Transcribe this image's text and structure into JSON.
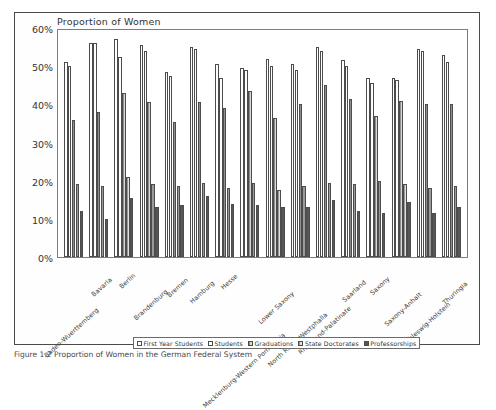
{
  "figure": {
    "caption": "Figure 1.2 Proportion of Women in the German Federal System"
  },
  "chart_data": {
    "type": "bar",
    "title": "Proportion of Women",
    "xlabel": "",
    "ylabel": "",
    "ylim": [
      0,
      60
    ],
    "ytick_labels": [
      "0%",
      "10%",
      "20%",
      "30%",
      "40%",
      "50%",
      "60%"
    ],
    "ytick_values": [
      0,
      10,
      20,
      30,
      40,
      50,
      60
    ],
    "grid": false,
    "legend_position": "bottom",
    "categories": [
      "Baden-Wuerttemberg",
      "Bavaria",
      "Berlin",
      "Brandenburg",
      "Bremen",
      "Hamburg",
      "Hesse",
      "Mecklenburg-Western Pomerania",
      "Lower Saxony",
      "North Rhine-Westphalia",
      "Rhineland-Palatinate",
      "Saarland",
      "Saxony",
      "Saxony-Anhalt",
      "Schleswig-Holstein",
      "Thuringia"
    ],
    "series": [
      {
        "name": "First Year Students",
        "values": [
          51,
          56,
          57,
          55.5,
          48.5,
          55,
          50.5,
          49.5,
          52,
          50.5,
          55,
          51.5,
          47,
          47,
          54.5,
          53
        ]
      },
      {
        "name": "Students",
        "values": [
          50,
          56,
          52.5,
          54,
          47.5,
          54.5,
          47,
          49,
          50,
          49,
          54,
          50,
          45.5,
          46.5,
          54,
          51
        ]
      },
      {
        "name": "Graduations",
        "values": [
          36,
          38,
          43,
          40.5,
          35.5,
          40.5,
          39,
          43.5,
          36.5,
          40,
          45,
          41.5,
          37,
          41,
          40,
          40
        ]
      },
      {
        "name": "State Doctorates",
        "values": [
          19,
          18.5,
          21,
          19,
          18.5,
          19.5,
          18,
          19.5,
          17.5,
          18.5,
          19.5,
          19,
          20,
          19,
          18,
          18.5
        ]
      },
      {
        "name": "Professorships",
        "values": [
          12,
          10,
          15.5,
          13,
          13.5,
          16,
          14,
          13.5,
          13,
          13,
          15,
          12,
          11.5,
          14.5,
          11.5,
          13
        ]
      }
    ]
  }
}
